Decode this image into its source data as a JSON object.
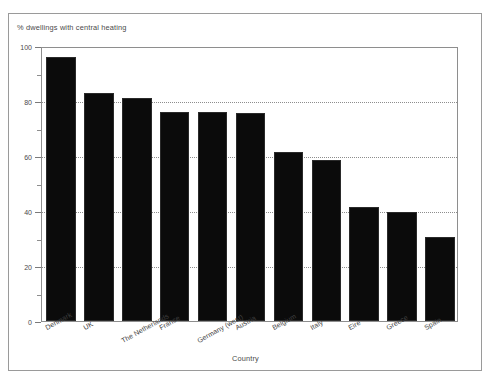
{
  "chart_data": {
    "type": "bar",
    "title": "% dwellings with central heating",
    "xlabel": "Country",
    "ylabel": "",
    "categories": [
      "Denmark",
      "UK",
      "The Netherlands",
      "France",
      "Germany (west)",
      "Austria",
      "Belgium",
      "Italy",
      "Eire",
      "Greece",
      "Spain"
    ],
    "values": [
      96,
      83,
      81,
      76,
      76,
      75.5,
      61.5,
      58.5,
      41.5,
      39.5,
      30.5
    ],
    "ylim": [
      0,
      100
    ],
    "ytick_labels": [
      "0",
      "20",
      "40",
      "60",
      "80",
      "100"
    ],
    "ytick_values": [
      0,
      20,
      40,
      60,
      80,
      100
    ],
    "yminor_values": [
      10,
      30,
      50,
      70,
      90
    ],
    "gridlines": [
      20,
      40,
      60,
      80
    ],
    "grid": true,
    "legend": "none",
    "bar_color": "#0b0b0b",
    "label_rotation": -29,
    "label_stagger": [
      0,
      0,
      1,
      0,
      1,
      0,
      0,
      0,
      0,
      0,
      0
    ]
  }
}
